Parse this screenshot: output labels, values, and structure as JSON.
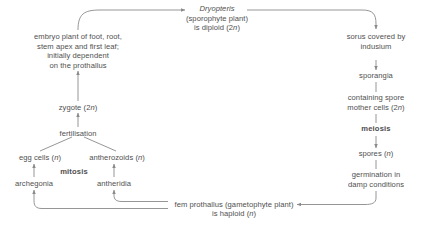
{
  "diagram": {
    "background": "#ffffff",
    "text_color": "#4f4f4f",
    "line_color": "#8a8a8a",
    "nodes": {
      "sporophyte": {
        "line1": "Dryopteris",
        "line2": "(sporophyte plant)",
        "line3": "is diploid (2n)"
      },
      "embryo": {
        "line1": "embryo plant of foot, root,",
        "line2": "stem apex and first leaf;",
        "line3": "initially dependent",
        "line4": "on the prothallus"
      },
      "zygote": "zygote (2n)",
      "fertilisation": "fertilisation",
      "egg_cells": "egg cells (n)",
      "antherozoids": "antherozoids (n)",
      "mitosis": "mitosis",
      "archegonia": "archegonia",
      "antheridia": "antheridia",
      "sorus": {
        "line1": "sorus covered by",
        "line2": "indusium"
      },
      "sporangia": "sporangia",
      "spore_mother_cells": {
        "line1": "containing spore",
        "line2": "mother cells (2n)"
      },
      "meiosis": "meiosis",
      "spores": "spores (n)",
      "germination": {
        "line1": "germination in",
        "line2": "damp conditions"
      },
      "gametophyte": {
        "line1": "fem prothallus (gametophyte plant)",
        "line2": "is haploid (n)"
      }
    }
  }
}
